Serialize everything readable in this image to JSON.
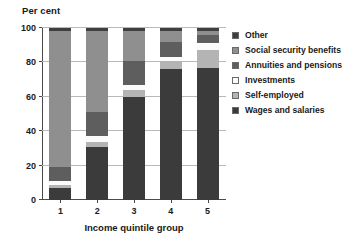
{
  "chart_data": {
    "type": "bar",
    "stacked": true,
    "stack_total": 100,
    "title": "",
    "ylabel": "Per cent",
    "xlabel": "Income quintile group",
    "categories": [
      "1",
      "2",
      "3",
      "4",
      "5"
    ],
    "ylim": [
      0,
      100
    ],
    "yticks": [
      0,
      20,
      40,
      60,
      80,
      100
    ],
    "ytick_labels": [
      "0",
      "20",
      "40",
      "60",
      "80",
      "100"
    ],
    "xtick_labels": [
      "1",
      "2",
      "3",
      "4",
      "5"
    ],
    "grid": "horizontal",
    "legend_position": "right",
    "series": [
      {
        "name": "Wages and salaries",
        "color": "#3b3b3b",
        "values": [
          7,
          31,
          60,
          76,
          77
        ]
      },
      {
        "name": "Self-employed",
        "color": "#b4b4b4",
        "values": [
          2,
          3,
          4,
          5,
          10
        ]
      },
      {
        "name": "Investments",
        "color": "#fbfbfb",
        "values": [
          2,
          3,
          3,
          2,
          4
        ]
      },
      {
        "name": "Annuities and pensions",
        "color": "#5e5e5e",
        "values": [
          8,
          14,
          14,
          9,
          5
        ]
      },
      {
        "name": "Social security benefits",
        "color": "#8f8f8f",
        "values": [
          79,
          47,
          17,
          6,
          2
        ]
      },
      {
        "name": "Other",
        "color": "#3f3f3f",
        "values": [
          2,
          2,
          2,
          2,
          2
        ]
      }
    ],
    "legend_order": [
      "Other",
      "Social security benefits",
      "Annuities and pensions",
      "Investments",
      "Self-employed",
      "Wages and salaries"
    ]
  },
  "colors": {
    "axis": "#4a4a4a",
    "grid": "#b9b9b9",
    "text": "#1a1a1a",
    "background": "#ffffff"
  }
}
